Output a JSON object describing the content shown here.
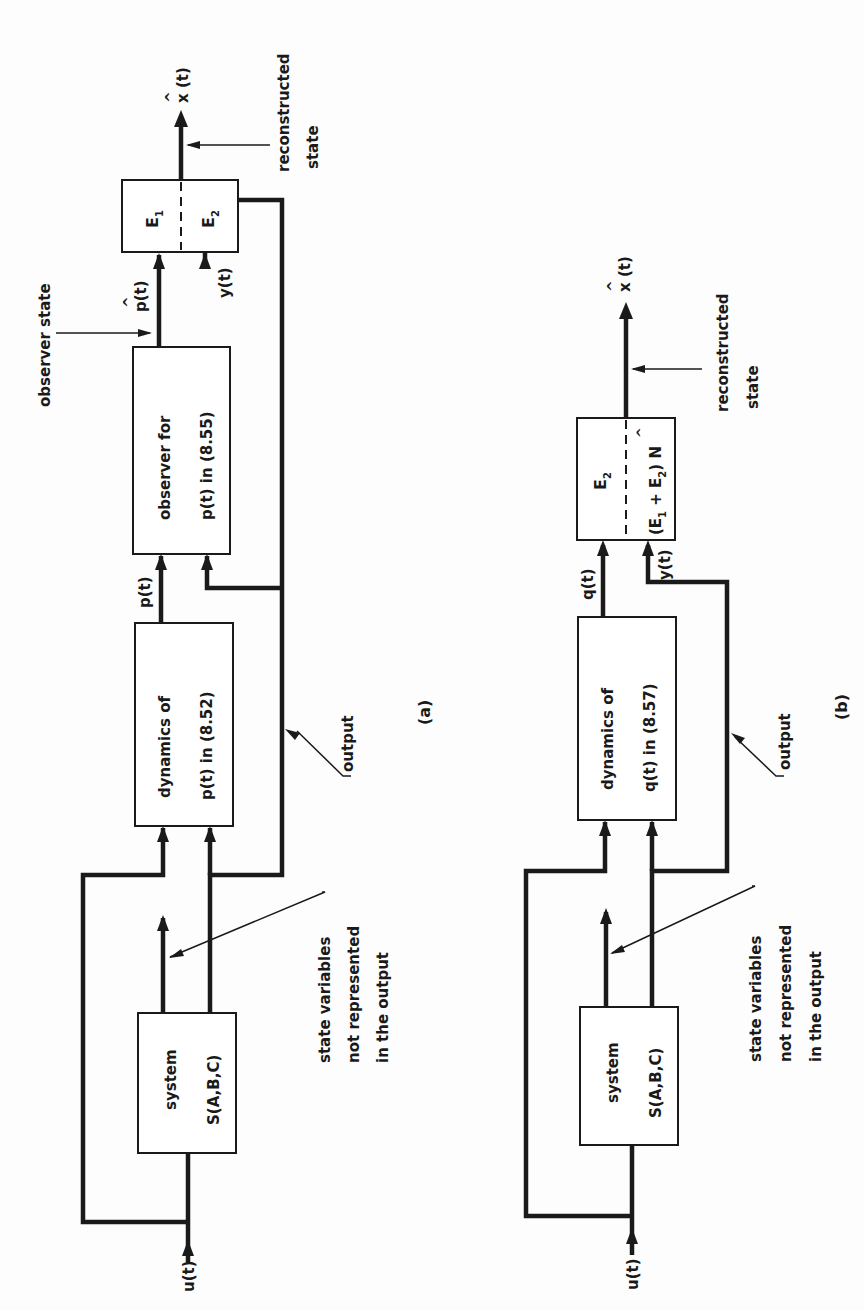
{
  "figure": {
    "orientation": "rotated 90 degrees counter-clockwise",
    "colors": {
      "ink": "#1a1a1a",
      "background": "#fdfdfd"
    }
  },
  "diagram_a": {
    "caption": "(a)",
    "input_label": "u(t)",
    "system_box": {
      "line1": "system",
      "line2": "S(A,B,C)"
    },
    "dynamics_box": {
      "line1": "dynamics of",
      "line2": "p(t) in (8.52)"
    },
    "observer_box": {
      "line1": "observer for",
      "line2": "p(t) in (8.55)"
    },
    "e_box": {
      "top": "E",
      "top_sub": "1",
      "bottom": "E",
      "bottom_sub": "2"
    },
    "signal_p": "p(t)",
    "signal_p_hat": "p(t)",
    "signal_p_hat_accent": "^",
    "signal_y": "y(t)",
    "output_signal": "x (t)",
    "output_accent": "^",
    "annotations": {
      "state_variables": [
        "state variables",
        "not represented",
        "in the output"
      ],
      "output": "output",
      "observer_state": "observer state",
      "reconstructed_state": [
        "reconstructed",
        "state"
      ]
    }
  },
  "diagram_b": {
    "caption": "(b)",
    "input_label": "u(t)",
    "system_box": {
      "line1": "system",
      "line2": "S(A,B,C)"
    },
    "dynamics_box": {
      "line1": "dynamics of",
      "line2": "q(t) in (8.57)"
    },
    "e_box": {
      "top": "E",
      "top_sub": "2",
      "bottom": "(E + E ) N",
      "bottom_sub1": "1",
      "bottom_sub2": "2",
      "bottom_accent": "^"
    },
    "signal_q": "q(t)",
    "signal_y": "y(t)",
    "output_signal": "x (t)",
    "output_accent": "^",
    "annotations": {
      "state_variables": [
        "state variables",
        "not represented",
        "in the output"
      ],
      "output": "output",
      "reconstructed_state": [
        "reconstructed",
        "state"
      ]
    }
  }
}
